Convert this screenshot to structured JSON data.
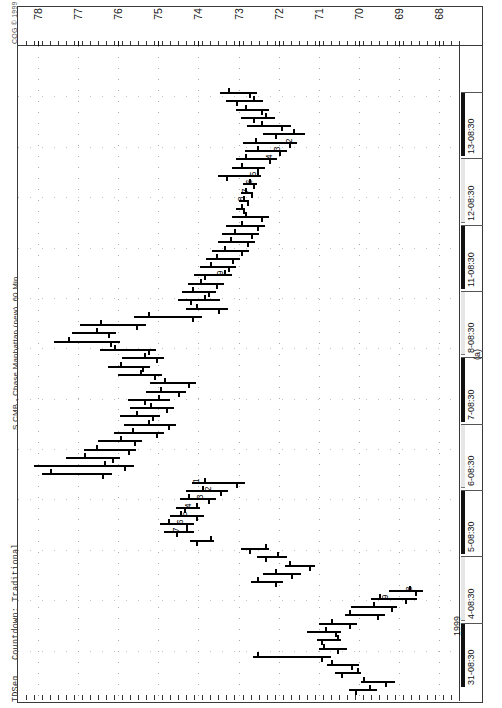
{
  "window": {
    "copyright": "CQG © 1999",
    "instrument_title": "S CMB - Chase Manhattan (new), 60 Min",
    "study_name": "TDSeq",
    "study_params": "Countdown: Traditional",
    "figure_label": "(a)",
    "year_label": "1999"
  },
  "chart_data": {
    "type": "bar",
    "title": "S CMB - Chase Manhattan (new), 60 Min",
    "subtitle": "CQG © 1999",
    "xlabel": "",
    "ylabel": "",
    "grid": true,
    "legend": "none",
    "orientation": "rotated-90",
    "ylim": [
      67.5,
      78.5
    ],
    "price_ticks": [
      78,
      77,
      76,
      75,
      74,
      73,
      72,
      71,
      70,
      69,
      68
    ],
    "time_ticks": [
      "31-08:30",
      "4-08:30",
      "5-08:30",
      "6-08:30",
      "7-08:30",
      "8-08:30",
      "11-08:30",
      "12-08:30",
      "13-08:30"
    ],
    "annotations": [
      {
        "label": "9",
        "group": "buy-countdown-lower",
        "price": 73.4,
        "bar_index": 50
      },
      {
        "label": "8",
        "group": "setup-lower",
        "price": 72.9,
        "bar_index": 59
      },
      {
        "label": "7",
        "group": "setup-lower",
        "price": 72.8,
        "bar_index": 60
      },
      {
        "label": "6",
        "group": "setup-lower",
        "price": 72.7,
        "bar_index": 61
      },
      {
        "label": "5",
        "group": "setup-lower",
        "price": 72.6,
        "bar_index": 62
      },
      {
        "label": "4",
        "group": "setup-lower",
        "price": 72.2,
        "bar_index": 64
      },
      {
        "label": "3",
        "group": "setup-lower",
        "price": 72.0,
        "bar_index": 65
      },
      {
        "label": "2",
        "group": "setup-lower",
        "price": 71.7,
        "bar_index": 66
      },
      {
        "label": "1",
        "group": "setup-upper",
        "price": 74.0,
        "bar_index": 25
      },
      {
        "label": "2",
        "group": "setup-upper",
        "price": 73.7,
        "bar_index": 24
      },
      {
        "label": "3",
        "group": "setup-upper",
        "price": 73.9,
        "bar_index": 23
      },
      {
        "label": "4",
        "group": "setup-upper",
        "price": 74.2,
        "bar_index": 22
      },
      {
        "label": "5",
        "group": "setup-upper",
        "price": 74.3,
        "bar_index": 21
      },
      {
        "label": "6",
        "group": "setup-upper",
        "price": 74.4,
        "bar_index": 20
      },
      {
        "label": "7",
        "group": "setup-upper",
        "price": 74.5,
        "bar_index": 19
      },
      {
        "label": "9",
        "group": "countdown-upper",
        "price": 69.3,
        "bar_index": 11
      },
      {
        "label": "8",
        "group": "countdown-upper",
        "price": 68.7,
        "bar_index": 12
      }
    ],
    "bars": [
      {
        "i": 0,
        "high": 70.25,
        "low": 69.55,
        "open": 69.75,
        "close": 70.1
      },
      {
        "i": 1,
        "high": 69.95,
        "low": 69.1,
        "open": 69.9,
        "close": 69.35
      },
      {
        "i": 2,
        "high": 70.6,
        "low": 69.95,
        "open": 70.05,
        "close": 70.45
      },
      {
        "i": 3,
        "high": 70.8,
        "low": 70.0,
        "open": 70.7,
        "close": 70.2
      },
      {
        "i": 4,
        "high": 72.65,
        "low": 70.7,
        "open": 72.55,
        "close": 70.95
      },
      {
        "i": 5,
        "high": 71.0,
        "low": 70.3,
        "open": 70.9,
        "close": 70.55
      },
      {
        "i": 6,
        "high": 71.05,
        "low": 70.45,
        "open": 70.55,
        "close": 70.95
      },
      {
        "i": 7,
        "high": 71.3,
        "low": 70.45,
        "open": 70.85,
        "close": 70.6
      },
      {
        "i": 8,
        "high": 71.0,
        "low": 70.05,
        "open": 70.7,
        "close": 70.25
      },
      {
        "i": 9,
        "high": 70.35,
        "low": 69.35,
        "open": 70.25,
        "close": 69.55
      },
      {
        "i": 10,
        "high": 70.2,
        "low": 69.05,
        "open": 69.65,
        "close": 69.2
      },
      {
        "i": 11,
        "high": 69.7,
        "low": 68.55,
        "open": 69.5,
        "close": 68.85
      },
      {
        "i": 12,
        "high": 69.25,
        "low": 68.4,
        "open": 68.75,
        "close": 68.6
      },
      {
        "i": 13,
        "high": 72.7,
        "low": 71.9,
        "open": 72.55,
        "close": 72.1
      },
      {
        "i": 14,
        "high": 72.4,
        "low": 71.45,
        "open": 72.1,
        "close": 71.7
      },
      {
        "i": 15,
        "high": 71.85,
        "low": 71.1,
        "open": 71.75,
        "close": 71.25
      },
      {
        "i": 16,
        "high": 72.55,
        "low": 71.8,
        "open": 72.05,
        "close": 72.35
      },
      {
        "i": 17,
        "high": 72.95,
        "low": 72.25,
        "open": 72.35,
        "close": 72.75
      },
      {
        "i": 18,
        "high": 74.2,
        "low": 73.6,
        "open": 73.7,
        "close": 74.05
      },
      {
        "i": 19,
        "high": 74.85,
        "low": 74.1,
        "open": 74.3,
        "close": 74.55
      },
      {
        "i": 20,
        "high": 74.95,
        "low": 74.1,
        "open": 74.75,
        "close": 74.3
      },
      {
        "i": 21,
        "high": 74.7,
        "low": 73.85,
        "open": 74.45,
        "close": 74.05
      },
      {
        "i": 22,
        "high": 74.55,
        "low": 73.95,
        "open": 74.05,
        "close": 74.35
      },
      {
        "i": 23,
        "high": 74.45,
        "low": 73.55,
        "open": 74.25,
        "close": 73.75
      },
      {
        "i": 24,
        "high": 74.3,
        "low": 73.25,
        "open": 73.9,
        "close": 73.45
      },
      {
        "i": 25,
        "high": 74.15,
        "low": 72.85,
        "open": 73.85,
        "close": 73.05
      },
      {
        "i": 26,
        "high": 77.9,
        "low": 76.15,
        "open": 77.7,
        "close": 76.4
      },
      {
        "i": 27,
        "high": 78.1,
        "low": 75.6,
        "open": 76.35,
        "close": 75.85
      },
      {
        "i": 28,
        "high": 77.3,
        "low": 75.95,
        "open": 76.85,
        "close": 76.15
      },
      {
        "i": 29,
        "high": 76.85,
        "low": 75.55,
        "open": 76.55,
        "close": 75.75
      },
      {
        "i": 30,
        "high": 76.5,
        "low": 75.4,
        "open": 75.95,
        "close": 75.6
      },
      {
        "i": 31,
        "high": 76.1,
        "low": 74.85,
        "open": 75.65,
        "close": 75.05
      },
      {
        "i": 32,
        "high": 75.85,
        "low": 74.55,
        "open": 75.25,
        "close": 74.75
      },
      {
        "i": 33,
        "high": 75.95,
        "low": 74.95,
        "open": 75.55,
        "close": 75.15
      },
      {
        "i": 34,
        "high": 75.7,
        "low": 74.6,
        "open": 75.2,
        "close": 74.8
      },
      {
        "i": 35,
        "high": 75.75,
        "low": 74.7,
        "open": 75.0,
        "close": 75.35
      },
      {
        "i": 36,
        "high": 75.3,
        "low": 74.3,
        "open": 74.95,
        "close": 74.5
      },
      {
        "i": 37,
        "high": 75.2,
        "low": 74.05,
        "open": 74.85,
        "close": 74.25
      },
      {
        "i": 38,
        "high": 76.0,
        "low": 74.9,
        "open": 75.45,
        "close": 75.1
      },
      {
        "i": 39,
        "high": 76.25,
        "low": 75.2,
        "open": 75.95,
        "close": 75.4
      },
      {
        "i": 40,
        "high": 75.9,
        "low": 74.85,
        "open": 75.35,
        "close": 75.05
      },
      {
        "i": 41,
        "high": 76.45,
        "low": 75.05,
        "open": 76.1,
        "close": 75.25
      },
      {
        "i": 42,
        "high": 77.6,
        "low": 75.95,
        "open": 77.25,
        "close": 76.2
      },
      {
        "i": 43,
        "high": 77.15,
        "low": 76.05,
        "open": 76.55,
        "close": 76.25
      },
      {
        "i": 44,
        "high": 76.95,
        "low": 75.3,
        "open": 76.45,
        "close": 75.55
      },
      {
        "i": 45,
        "high": 75.6,
        "low": 73.9,
        "open": 75.25,
        "close": 74.15
      },
      {
        "i": 46,
        "high": 74.3,
        "low": 73.25,
        "open": 74.05,
        "close": 73.5
      },
      {
        "i": 47,
        "high": 74.5,
        "low": 73.45,
        "open": 73.85,
        "close": 74.2
      },
      {
        "i": 48,
        "high": 74.4,
        "low": 73.55,
        "open": 74.15,
        "close": 73.75
      },
      {
        "i": 49,
        "high": 74.25,
        "low": 73.35,
        "open": 73.95,
        "close": 73.55
      },
      {
        "i": 50,
        "high": 74.1,
        "low": 73.15,
        "open": 73.35,
        "close": 73.85
      },
      {
        "i": 51,
        "high": 73.95,
        "low": 73.05,
        "open": 73.7,
        "close": 73.25
      },
      {
        "i": 52,
        "high": 73.8,
        "low": 72.95,
        "open": 73.55,
        "close": 73.15
      },
      {
        "i": 53,
        "high": 73.65,
        "low": 72.75,
        "open": 73.35,
        "close": 72.95
      },
      {
        "i": 54,
        "high": 73.5,
        "low": 72.6,
        "open": 73.2,
        "close": 72.8
      },
      {
        "i": 55,
        "high": 73.4,
        "low": 72.5,
        "open": 73.1,
        "close": 72.7
      },
      {
        "i": 56,
        "high": 73.3,
        "low": 72.35,
        "open": 72.95,
        "close": 72.55
      },
      {
        "i": 57,
        "high": 73.15,
        "low": 72.25,
        "open": 72.85,
        "close": 72.45
      },
      {
        "i": 58,
        "high": 73.05,
        "low": 72.85,
        "open": 72.95,
        "close": 72.9
      },
      {
        "i": 59,
        "high": 73.0,
        "low": 72.75,
        "open": 72.9,
        "close": 72.8
      },
      {
        "i": 60,
        "high": 72.95,
        "low": 72.65,
        "open": 72.85,
        "close": 72.7
      },
      {
        "i": 61,
        "high": 72.9,
        "low": 72.55,
        "open": 72.75,
        "close": 72.65
      },
      {
        "i": 62,
        "high": 73.5,
        "low": 72.45,
        "open": 72.55,
        "close": 73.3
      },
      {
        "i": 63,
        "high": 73.15,
        "low": 72.35,
        "open": 72.95,
        "close": 72.55
      },
      {
        "i": 64,
        "high": 73.05,
        "low": 72.05,
        "open": 72.85,
        "close": 72.25
      },
      {
        "i": 65,
        "high": 72.85,
        "low": 71.8,
        "open": 72.55,
        "close": 72.0
      },
      {
        "i": 66,
        "high": 72.9,
        "low": 71.55,
        "open": 72.6,
        "close": 71.75
      },
      {
        "i": 67,
        "high": 72.4,
        "low": 71.35,
        "open": 71.65,
        "close": 72.1
      },
      {
        "i": 68,
        "high": 72.8,
        "low": 71.7,
        "open": 72.45,
        "close": 71.95
      },
      {
        "i": 69,
        "high": 72.95,
        "low": 72.1,
        "open": 72.35,
        "close": 72.65
      },
      {
        "i": 70,
        "high": 73.05,
        "low": 72.25,
        "open": 72.85,
        "close": 72.45
      },
      {
        "i": 71,
        "high": 73.3,
        "low": 72.4,
        "open": 72.65,
        "close": 73.05
      },
      {
        "i": 72,
        "high": 73.45,
        "low": 72.55,
        "open": 73.25,
        "close": 72.75
      }
    ]
  }
}
